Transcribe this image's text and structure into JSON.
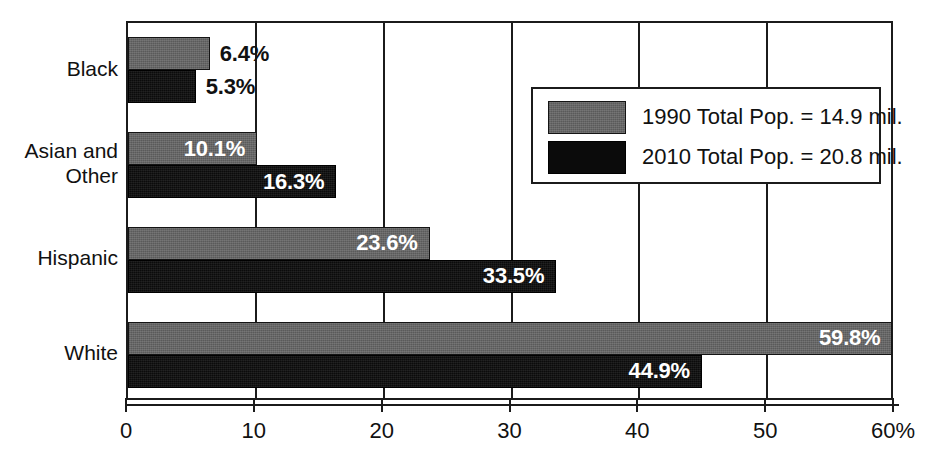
{
  "chart_data": {
    "type": "bar",
    "orientation": "horizontal",
    "title": "",
    "subtitle": "",
    "xlabel": "",
    "ylabel": "",
    "xlim": [
      0,
      60
    ],
    "xticks": [
      0,
      10,
      20,
      30,
      40,
      50,
      60
    ],
    "xtick_labels": [
      "0",
      "10",
      "20",
      "30",
      "40",
      "50",
      "60%"
    ],
    "grid": true,
    "grid_axis": "x",
    "legend_position": "upper right inside plot",
    "categories": [
      "Black",
      "Asian and\nOther",
      "Hispanic",
      "White"
    ],
    "series": [
      {
        "name": "1990 Total Pop. = 14.9 mil.",
        "color": "#666666",
        "values": [
          6.4,
          10.1,
          23.6,
          59.8
        ],
        "data_labels": [
          "6.4%",
          "10.1%",
          "23.6%",
          "59.8%"
        ],
        "label_placement": [
          "outside",
          "inside",
          "inside",
          "inside"
        ]
      },
      {
        "name": "2010 Total Pop. = 20.8 mil.",
        "color": "#0b0b0b",
        "values": [
          5.3,
          16.3,
          33.5,
          44.9
        ],
        "data_labels": [
          "5.3%",
          "16.3%",
          "33.5%",
          "44.9%"
        ],
        "label_placement": [
          "outside",
          "inside",
          "inside",
          "inside"
        ]
      }
    ]
  },
  "legend": {
    "entries": [
      {
        "label": "1990 Total Pop. = 14.9 mil.",
        "swatch": "series-1990"
      },
      {
        "label": "2010 Total Pop. = 20.8 mil.",
        "swatch": "series-2010"
      }
    ]
  },
  "axis": {
    "tick_labels": [
      "0",
      "10",
      "20",
      "30",
      "40",
      "50",
      "60%"
    ]
  },
  "categories": [
    {
      "label": "Black"
    },
    {
      "label": "Asian and\nOther"
    },
    {
      "label": "Hispanic"
    },
    {
      "label": "White"
    }
  ],
  "colors": {
    "series_1990": "#666666",
    "series_2010": "#0b0b0b",
    "axis": "#1b1b1b",
    "background": "#ffffff",
    "label_inside": "#ffffff",
    "label_outside": "#111111"
  }
}
